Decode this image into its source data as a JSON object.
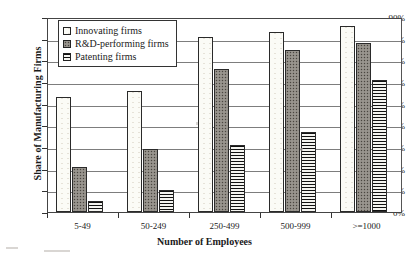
{
  "chart_data": {
    "type": "bar",
    "title": "",
    "xlabel": "Number of Employees",
    "ylabel": "Share of Manufacturing Firms",
    "categories": [
      "5-49",
      "50-249",
      "250-499",
      "500-999",
      ">=1000"
    ],
    "series": [
      {
        "name": "Innovating firms",
        "values": [
          53,
          56,
          81,
          83,
          86
        ]
      },
      {
        "name": "R&D-performing firms",
        "values": [
          21,
          29,
          66,
          75,
          78
        ]
      },
      {
        "name": "Patenting firms",
        "values": [
          5,
          10,
          31,
          37,
          61
        ]
      }
    ],
    "ylim": [
      0,
      90
    ],
    "ytick_labels": [
      "0%",
      "10%",
      "20%",
      "30%",
      "40%",
      "50%",
      "60%",
      "70%",
      "80%",
      "90%"
    ],
    "ytick_values": [
      0,
      10,
      20,
      30,
      40,
      50,
      60,
      70,
      80,
      90
    ],
    "grid": true,
    "legend_position": "upper-left-inside"
  },
  "legend": {
    "items": [
      {
        "label": "Innovating firms",
        "swatch": "open-square-swatch"
      },
      {
        "label": "R&D-performing firms",
        "swatch": "dotted-square-swatch"
      },
      {
        "label": "Patenting firms",
        "swatch": "hatched-square-swatch"
      }
    ]
  }
}
